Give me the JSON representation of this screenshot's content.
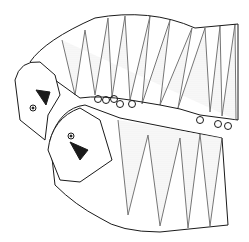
{
  "image": {
    "description": "Line drawing of two segmented arthropods (larvae) in a mating position, stippled segments",
    "background": "#ffffff",
    "ink": "#1a1a1a",
    "stipple": "#bdbdbd"
  }
}
